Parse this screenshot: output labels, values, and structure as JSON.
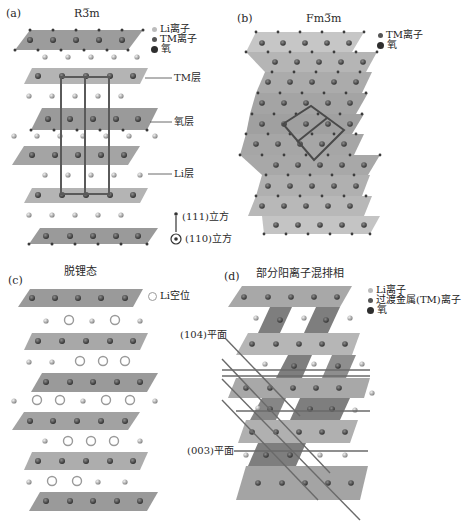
{
  "panels": {
    "a": {
      "tag": "(a)",
      "title": "R3̅m",
      "legend": [
        "Li离子",
        "TM离子",
        "氧"
      ],
      "labels": {
        "tm_layer": "TM层",
        "oxygen_layer": "氧层",
        "li_layer": "Li层",
        "dir_111": "(111)立方",
        "dir_110": "(110)立方"
      }
    },
    "b": {
      "tag": "(b)",
      "title": "Fm3̅m",
      "legend": [
        "TM离子",
        "氧"
      ]
    },
    "c": {
      "tag": "(c)",
      "title": "脱锂态",
      "legend": [
        "Li空位"
      ]
    },
    "d": {
      "tag": "(d)",
      "title": "部分阳离子混排相",
      "legend": [
        "Li离子",
        "过渡金属(TM)离子",
        "氧"
      ],
      "labels": {
        "plane_104": "(104)平面",
        "plane_003": "(003)平面"
      }
    }
  },
  "colors": {
    "slab_dark": "#8a8a8a",
    "slab_mid": "#a9a9a9",
    "slab_light": "#c4c4c4",
    "tm_ion": "#3d3d3d",
    "oxygen": "#4a4a4a",
    "li_ion": "#9a9a9a",
    "cell_line": "#5a5a5a"
  }
}
